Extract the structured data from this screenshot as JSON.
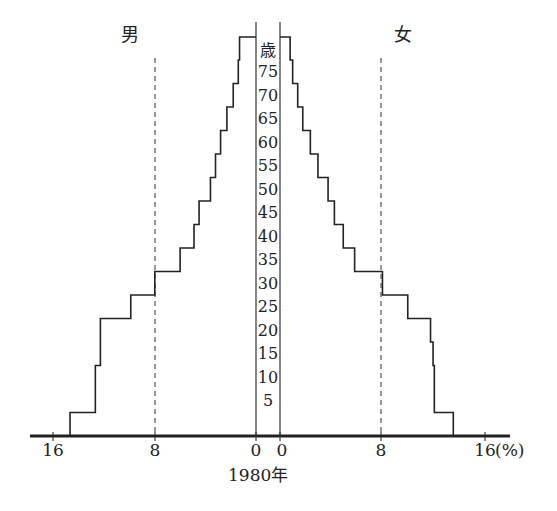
{
  "labels": {
    "male": "男",
    "female": "女",
    "age_unit": "歳",
    "year": "1980年",
    "percent_unit": "(%)"
  },
  "x_ticks": {
    "left": [
      "16",
      "8",
      "0"
    ],
    "right": [
      "0",
      "8",
      "16"
    ]
  },
  "age_ticks": [
    "75",
    "70",
    "65",
    "60",
    "55",
    "50",
    "45",
    "40",
    "35",
    "30",
    "25",
    "20",
    "15",
    "10",
    "5"
  ],
  "chart_data": {
    "type": "bar",
    "subtype": "population-pyramid",
    "title": "1980年",
    "xlabel": "(%)",
    "ylabel": "歳",
    "xlim": [
      0,
      16
    ],
    "reference_lines": [
      8
    ],
    "categories": [
      "0-4",
      "5-9",
      "10-14",
      "15-19",
      "20-24",
      "25-29",
      "30-34",
      "35-39",
      "40-44",
      "45-49",
      "50-54",
      "55-59",
      "60-64",
      "65-69",
      "70-74",
      "75-79",
      "80+"
    ],
    "series": [
      {
        "name": "男",
        "values": [
          14.7,
          12.7,
          12.7,
          12.3,
          12.3,
          9.9,
          8.0,
          6.0,
          4.9,
          4.5,
          3.6,
          3.2,
          2.8,
          2.3,
          1.8,
          1.4,
          1.3
        ]
      },
      {
        "name": "女",
        "values": [
          13.7,
          12.2,
          12.2,
          12.1,
          11.9,
          10.1,
          8.1,
          5.9,
          5.0,
          4.3,
          3.8,
          3.0,
          2.4,
          1.8,
          1.4,
          1.0,
          0.8
        ]
      }
    ]
  }
}
